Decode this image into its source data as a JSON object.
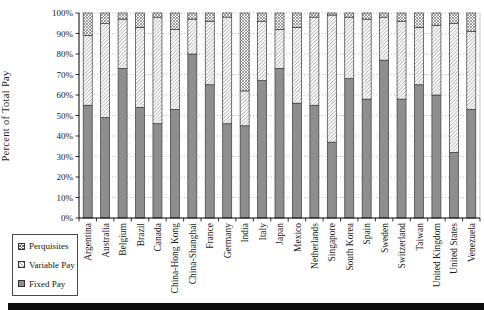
{
  "chart_data": {
    "type": "bar",
    "stacked": true,
    "title": "",
    "xlabel": "",
    "ylabel": "Percent of Total Pay",
    "ylim": [
      0,
      100
    ],
    "grid": true,
    "legend_position": "bottom-left",
    "yticks": [
      "0%",
      "10%",
      "20%",
      "30%",
      "40%",
      "50%",
      "60%",
      "70%",
      "80%",
      "90%",
      "100%"
    ],
    "categories": [
      "Argentina",
      "Australia",
      "Belgium",
      "Brazil",
      "Canada",
      "China-Hong Kong",
      "China-Shanghai",
      "France",
      "Germany",
      "India",
      "Italy",
      "Japan",
      "Mexico",
      "Netherlands",
      "Singapore",
      "South Korea",
      "Spain",
      "Sweden",
      "Switzerland",
      "Taiwan",
      "United Kingdom",
      "United States",
      "Venezuela"
    ],
    "series": [
      {
        "name": "Fixed Pay",
        "pattern": "solid",
        "values": [
          55,
          49,
          73,
          54,
          46,
          53,
          80,
          65,
          46,
          45,
          67,
          73,
          56,
          55,
          37,
          68,
          58,
          77,
          58,
          65,
          60,
          32,
          53
        ]
      },
      {
        "name": "Variable Pay",
        "pattern": "diagonal-hatch",
        "values": [
          34,
          46,
          24,
          39,
          52,
          39,
          17,
          31,
          52,
          17,
          29,
          19,
          37,
          43,
          62,
          30,
          39,
          21,
          38,
          28,
          34,
          63,
          38
        ]
      },
      {
        "name": "Perquisites",
        "pattern": "crosshatch",
        "values": [
          11,
          5,
          3,
          7,
          2,
          8,
          3,
          4,
          2,
          38,
          4,
          8,
          7,
          2,
          1,
          2,
          3,
          2,
          4,
          7,
          6,
          5,
          9
        ]
      }
    ],
    "colors": {
      "fixed_fill": "#8e8e8e",
      "variable_hatch_line": "#909090",
      "perquisites_hatch_line": "#767676",
      "bar_border": "#3a3a3a",
      "gridline": "#b4b4b4",
      "axis": "#000000",
      "text": "#1a1a1a",
      "bottom_band": "#0e0e0e"
    }
  }
}
